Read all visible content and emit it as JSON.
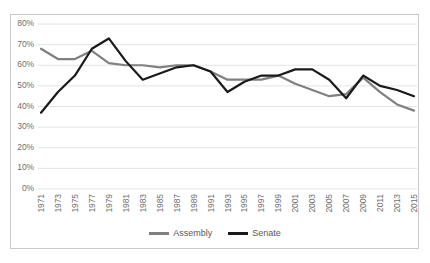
{
  "chart_data": {
    "type": "line",
    "title": "",
    "subtitle": "",
    "xlabel": "",
    "ylabel": "",
    "x": [
      1971,
      1973,
      1975,
      1977,
      1979,
      1981,
      1983,
      1985,
      1987,
      1989,
      1991,
      1993,
      1995,
      1997,
      1999,
      2001,
      2003,
      2005,
      2007,
      2009,
      2011,
      2013,
      2015
    ],
    "xtick_labels": [
      "1971",
      "1973",
      "1975",
      "1977",
      "1979",
      "1981",
      "1983",
      "1985",
      "1987",
      "1989",
      "1991",
      "1993",
      "1995",
      "1997",
      "1999",
      "2001",
      "2003",
      "2005",
      "2007",
      "2009",
      "2011",
      "2013",
      "2015"
    ],
    "ytick_labels": [
      "80%",
      "70%",
      "60%",
      "50%",
      "40%",
      "30%",
      "20%",
      "10%",
      "0%"
    ],
    "ytick_values": [
      80,
      70,
      60,
      50,
      40,
      30,
      20,
      10,
      0
    ],
    "ylim": [
      0,
      80
    ],
    "xlim": [
      1971,
      2015
    ],
    "grid": "horizontal",
    "legend_position": "bottom-center",
    "series": [
      {
        "name": "Assembly",
        "color": "#808080",
        "values": [
          68,
          63,
          63,
          67,
          61,
          60,
          60,
          59,
          60,
          60,
          57,
          53,
          53,
          53,
          55,
          51,
          48,
          45,
          46,
          54,
          47,
          41,
          38
        ]
      },
      {
        "name": "Senate",
        "color": "#1a1a1a",
        "values": [
          37,
          47,
          55,
          68,
          73,
          62,
          53,
          56,
          59,
          60,
          57,
          47,
          52,
          55,
          55,
          58,
          58,
          53,
          44,
          55,
          50,
          48,
          45
        ]
      }
    ]
  },
  "legend": {
    "entries": [
      {
        "label": "Assembly",
        "color": "#808080"
      },
      {
        "label": "Senate",
        "color": "#1a1a1a"
      }
    ]
  },
  "colors": {
    "assembly": "#808080",
    "senate": "#1a1a1a",
    "gridline": "#e4e4e4",
    "border": "#c9c9c9",
    "tick_text": "#6f6f6f"
  }
}
